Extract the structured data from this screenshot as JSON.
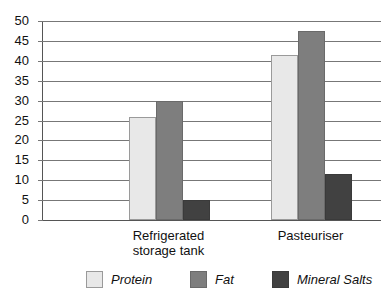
{
  "chart_data": {
    "type": "bar",
    "title": "",
    "subtitle": "",
    "xlabel": "",
    "ylabel": "",
    "categories": [
      "Refrigerated storage tank",
      "Pasteuriser"
    ],
    "category_lines": [
      [
        "Refrigerated",
        "storage tank"
      ],
      [
        "Pasteuriser"
      ]
    ],
    "series": [
      {
        "name": "Protein",
        "values": [
          26,
          41.5
        ],
        "color": "#e8e8e8"
      },
      {
        "name": "Fat",
        "values": [
          30,
          47.5
        ],
        "color": "#7e7e7e"
      },
      {
        "name": "Mineral Salts",
        "values": [
          5,
          11.5
        ],
        "color": "#414141"
      }
    ],
    "ylim": [
      0,
      50
    ],
    "ytick_step": 5,
    "yticks": [
      50,
      45,
      40,
      35,
      30,
      25,
      20,
      15,
      10,
      5,
      0
    ],
    "ytick_labels": [
      "50",
      "45",
      "40",
      "35",
      "30",
      "25",
      "20",
      "15",
      "10",
      "5",
      "0"
    ],
    "grid": true,
    "grid_axis": "y",
    "legend_position": "bottom",
    "legend_entries": [
      "Protein",
      "Fat",
      "Mineral Salts"
    ],
    "axis_color": "#555555",
    "grid_color": "#777777",
    "background_color": "#ffffff"
  }
}
